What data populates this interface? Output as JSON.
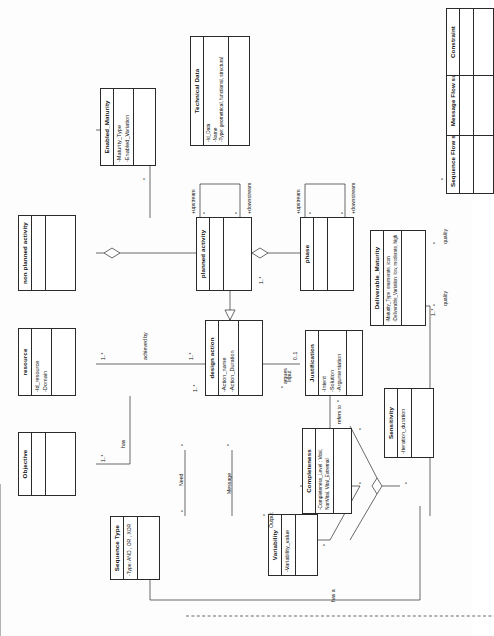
{
  "diagram": {
    "orientation": "rotated-90"
  },
  "classes": {
    "objective": {
      "name": "Objective",
      "attrs": []
    },
    "resource": {
      "name": "resource",
      "attrs": [
        "-Id_resource",
        "-Domain"
      ]
    },
    "non_planned_activity": {
      "name": "non planned activity",
      "attrs": []
    },
    "sequence_type": {
      "name": "Sequence Type",
      "attrs": [
        "-Type: AND , OR , XOR"
      ]
    },
    "planned_activity": {
      "name": "planned activity",
      "attrs": []
    },
    "enabled_maturity": {
      "name": "Enabled_Maturity",
      "attrs": [
        "-Maturity_Type",
        "-Enabled_Variation"
      ]
    },
    "design_action": {
      "name": "design action",
      "attrs": [
        "-Action_name",
        "-Action_Duration"
      ]
    },
    "phase": {
      "name": "phase",
      "attrs": []
    },
    "deliverable_maturity": {
      "name": "Deliverable_Maturity",
      "attrs": [
        "-Maturity_Type: enumerate, icon",
        "-Deliverable_Variation: low, moderate, high"
      ]
    },
    "variability": {
      "name": "Variability",
      "attrs": [
        "-Variability_value"
      ]
    },
    "completeness": {
      "name": "Completeness",
      "attrs": [
        "-Completeness_Level : Vital,",
        "NonVital, Vital_Extremal"
      ]
    },
    "sensitivity": {
      "name": "Sensitivity",
      "attrs": [
        "-Iteration_duration"
      ]
    },
    "justification": {
      "name": "Justification",
      "attrs": [
        "-Intent",
        "-Solution",
        "-Argumentation"
      ]
    },
    "sequence_flow_support": {
      "name": "Sequence Flow support",
      "attrs": []
    },
    "message_flow_support": {
      "name": "Message Flow support",
      "attrs": []
    },
    "constraint": {
      "name": "Constraint",
      "attrs": []
    },
    "technical_data": {
      "name": "Technical Data",
      "attrs": [
        "-Id_Data",
        "-Name",
        "-Type: geometrical, functional, structural"
      ]
    }
  },
  "associations": [
    {
      "id": "has",
      "label": "has"
    },
    {
      "id": "need",
      "label": "Need"
    },
    {
      "id": "achieved_by",
      "label": "achieved by"
    },
    {
      "id": "message",
      "label": "Message"
    },
    {
      "id": "output",
      "label": "Output"
    },
    {
      "id": "input",
      "label": "Input"
    },
    {
      "id": "argues",
      "label": "argues"
    },
    {
      "id": "refers_to",
      "label": "refers to"
    },
    {
      "id": "has_a",
      "label": "has a"
    },
    {
      "id": "quality_1",
      "label": "quality"
    },
    {
      "id": "quality_2",
      "label": "quality"
    }
  ],
  "roles": [
    {
      "id": "upstream_pa",
      "label": "+upstream"
    },
    {
      "id": "downstream_pa",
      "label": "+downstream"
    },
    {
      "id": "upstream_ph",
      "label": "+upstream"
    },
    {
      "id": "downstream_ph",
      "label": "+downstream"
    }
  ],
  "multiplicities": {
    "objective_end": "1..*",
    "has_end": "1..*",
    "resource_end": "1..*",
    "achieved_by_end": "1..*",
    "design_action_a": "1..*",
    "design_action_b": "1..*",
    "need_end": "*",
    "message_end": "*",
    "sequence_type_end": "*",
    "planned_activity_end": "1..*",
    "phase_upstream": "*",
    "phase_downstream": "*",
    "pa_upstream": "*",
    "pa_downstream": "*",
    "enabled_end": "*",
    "deliverable_end": "1..*",
    "justification_end": "0..1",
    "justification_low": "*",
    "variability_end": "*",
    "completeness_end": "*",
    "sensitivity_end": "*",
    "technical_data_end": "*",
    "quality_end_1": "*",
    "quality_end_2": "*",
    "output_end": "*",
    "input_end": "*",
    "flow_end": "*"
  }
}
